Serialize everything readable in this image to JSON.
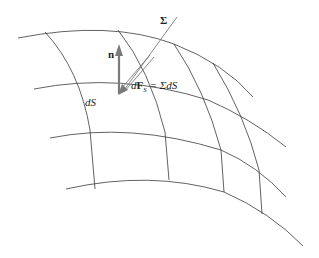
{
  "figure": {
    "labels": {
      "normal": "n",
      "stress_tensor": "Σ",
      "surface_element": "dS",
      "force_lhs_d": "d",
      "force_lhs_F": "F",
      "force_lhs_sub": "S",
      "force_rhs": " = ΣdS"
    },
    "colors": {
      "grid": "#3a3a3a",
      "vectors": "#7a7a7a",
      "text": "#222222"
    }
  }
}
